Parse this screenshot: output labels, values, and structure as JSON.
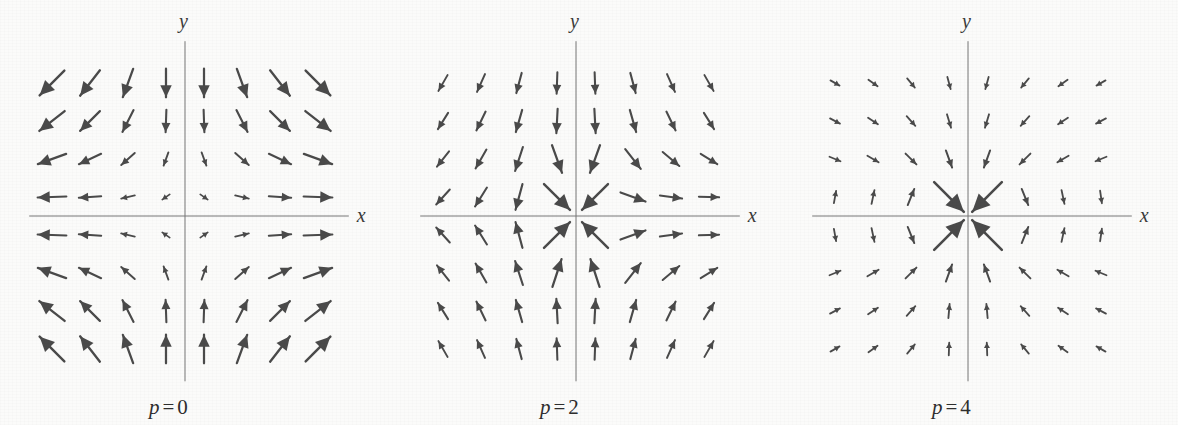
{
  "figure": {
    "background_color": "#fbfbfa",
    "ink_color": "#4a4a4a",
    "axis_color": "#777777",
    "width": 1178,
    "height": 425
  },
  "panels": [
    {
      "id": "panel-p0",
      "caption_symbol": "p",
      "caption_eq": "=",
      "caption_value": "0",
      "caption_full": "p = 0",
      "x_axis_label": "x",
      "y_axis_label": "y",
      "origin_x": 185,
      "origin_y": 216,
      "grid_spacing": 38,
      "grid_n": 8,
      "arrow_scale": 1.0
    },
    {
      "id": "panel-p2",
      "caption_symbol": "p",
      "caption_eq": "=",
      "caption_value": "2",
      "caption_full": "p = 2",
      "x_axis_label": "x",
      "y_axis_label": "y",
      "origin_x": 576,
      "origin_y": 216,
      "grid_spacing": 38,
      "grid_n": 8,
      "arrow_scale": 1.0
    },
    {
      "id": "panel-p4",
      "caption_symbol": "p",
      "caption_eq": "=",
      "caption_value": "4",
      "caption_full": "p = 4",
      "x_axis_label": "x",
      "y_axis_label": "y",
      "origin_x": 968,
      "origin_y": 216,
      "grid_spacing": 38,
      "grid_n": 8,
      "arrow_scale": 1.0
    }
  ],
  "chart_data": [
    {
      "type": "quiver",
      "title": "p = 0",
      "xlabel": "x",
      "ylabel": "y",
      "p": 0,
      "grid_x": [
        -3.5,
        -2.5,
        -1.5,
        -0.5,
        0.5,
        1.5,
        2.5,
        3.5
      ],
      "grid_y": [
        3.5,
        2.5,
        1.5,
        0.5,
        -0.5,
        -1.5,
        -2.5,
        -3.5
      ],
      "xlim": [
        -4,
        4
      ],
      "ylim": [
        -4,
        4
      ],
      "grid": false,
      "legend": "none",
      "description": "Rotational direction field; arrow direction angle = atan2(x, -y) style vortex, magnitude grows with distance from origin.",
      "angles_deg": [
        [
          225,
          232,
          250,
          270,
          270,
          290,
          308,
          315
        ],
        [
          218,
          225,
          243,
          268,
          272,
          297,
          315,
          322
        ],
        [
          200,
          205,
          222,
          250,
          290,
          318,
          335,
          340
        ],
        [
          182,
          184,
          193,
          215,
          325,
          347,
          356,
          358
        ],
        [
          178,
          176,
          167,
          145,
          35,
          13,
          4,
          2
        ],
        [
          160,
          155,
          138,
          110,
          70,
          42,
          25,
          20
        ],
        [
          142,
          135,
          117,
          92,
          88,
          63,
          45,
          38
        ],
        [
          135,
          128,
          110,
          90,
          90,
          70,
          52,
          45
        ]
      ],
      "magnitudes": [
        [
          1.0,
          0.92,
          0.86,
          0.82,
          0.82,
          0.86,
          0.92,
          1.0
        ],
        [
          0.92,
          0.8,
          0.7,
          0.64,
          0.64,
          0.7,
          0.8,
          0.92
        ],
        [
          0.86,
          0.7,
          0.52,
          0.4,
          0.4,
          0.52,
          0.7,
          0.86
        ],
        [
          0.82,
          0.64,
          0.4,
          0.26,
          0.26,
          0.4,
          0.64,
          0.82
        ],
        [
          0.82,
          0.64,
          0.4,
          0.26,
          0.26,
          0.4,
          0.64,
          0.82
        ],
        [
          0.86,
          0.7,
          0.52,
          0.4,
          0.4,
          0.52,
          0.7,
          0.86
        ],
        [
          0.92,
          0.8,
          0.7,
          0.64,
          0.64,
          0.7,
          0.8,
          0.92
        ],
        [
          1.0,
          0.92,
          0.86,
          0.82,
          0.82,
          0.86,
          0.92,
          1.0
        ]
      ]
    },
    {
      "type": "quiver",
      "title": "p = 2",
      "xlabel": "x",
      "ylabel": "y",
      "p": 2,
      "grid_x": [
        -3.5,
        -2.5,
        -1.5,
        -0.5,
        0.5,
        1.5,
        2.5,
        3.5
      ],
      "grid_y": [
        3.5,
        2.5,
        1.5,
        0.5,
        -0.5,
        -1.5,
        -2.5,
        -3.5
      ],
      "xlim": [
        -4,
        4
      ],
      "ylim": [
        -4,
        4
      ],
      "grid": false,
      "legend": "none",
      "description": "Direction field with p = 2 angular winding; strong diagonal outflow arrows adjacent to the origin.",
      "angles_deg": [
        [
          240,
          246,
          255,
          268,
          272,
          285,
          294,
          300
        ],
        [
          238,
          244,
          254,
          267,
          273,
          286,
          296,
          302
        ],
        [
          232,
          240,
          252,
          290,
          250,
          308,
          320,
          328
        ],
        [
          228,
          238,
          255,
          315,
          225,
          340,
          352,
          358
        ],
        [
          132,
          122,
          105,
          45,
          135,
          20,
          8,
          2
        ],
        [
          128,
          120,
          108,
          72,
          108,
          52,
          40,
          32
        ],
        [
          122,
          116,
          106,
          93,
          87,
          74,
          64,
          58
        ],
        [
          120,
          114,
          105,
          92,
          88,
          75,
          66,
          60
        ]
      ],
      "magnitudes": [
        [
          0.52,
          0.56,
          0.6,
          0.62,
          0.62,
          0.6,
          0.56,
          0.52
        ],
        [
          0.55,
          0.6,
          0.66,
          0.7,
          0.7,
          0.66,
          0.6,
          0.55
        ],
        [
          0.56,
          0.62,
          0.72,
          0.84,
          0.84,
          0.72,
          0.62,
          0.56
        ],
        [
          0.58,
          0.64,
          0.76,
          1.05,
          1.05,
          0.76,
          0.64,
          0.58
        ],
        [
          0.58,
          0.64,
          0.76,
          1.05,
          1.05,
          0.76,
          0.64,
          0.58
        ],
        [
          0.56,
          0.62,
          0.72,
          0.84,
          0.84,
          0.72,
          0.62,
          0.56
        ],
        [
          0.55,
          0.6,
          0.66,
          0.7,
          0.7,
          0.66,
          0.6,
          0.55
        ],
        [
          0.52,
          0.56,
          0.6,
          0.62,
          0.62,
          0.6,
          0.56,
          0.52
        ]
      ]
    },
    {
      "type": "quiver",
      "title": "p = 4",
      "xlabel": "x",
      "ylabel": "y",
      "p": 4,
      "grid_x": [
        -3.5,
        -2.5,
        -1.5,
        -0.5,
        0.5,
        1.5,
        2.5,
        3.5
      ],
      "grid_y": [
        3.5,
        2.5,
        1.5,
        0.5,
        -0.5,
        -1.5,
        -2.5,
        -3.5
      ],
      "xlim": [
        -4,
        4
      ],
      "ylim": [
        -4,
        4
      ],
      "grid": false,
      "legend": "none",
      "description": "Direction field with p = 4 angular winding; four long arrows form a diamond outline around the origin, remaining arrows are short.",
      "angles_deg": [
        [
          330,
          325,
          310,
          285,
          255,
          230,
          215,
          210
        ],
        [
          332,
          326,
          312,
          287,
          253,
          228,
          214,
          208
        ],
        [
          338,
          330,
          315,
          290,
          250,
          225,
          210,
          202
        ],
        [
          80,
          78,
          68,
          315,
          225,
          292,
          282,
          278
        ],
        [
          280,
          282,
          292,
          45,
          135,
          68,
          78,
          82
        ],
        [
          22,
          30,
          45,
          70,
          110,
          135,
          150,
          158
        ],
        [
          28,
          34,
          48,
          85,
          95,
          132,
          146,
          152
        ],
        [
          30,
          36,
          50,
          88,
          92,
          130,
          144,
          150
        ]
      ],
      "magnitudes": [
        [
          0.3,
          0.32,
          0.34,
          0.36,
          0.36,
          0.34,
          0.32,
          0.3
        ],
        [
          0.32,
          0.34,
          0.37,
          0.4,
          0.4,
          0.37,
          0.34,
          0.32
        ],
        [
          0.34,
          0.37,
          0.44,
          0.52,
          0.52,
          0.44,
          0.37,
          0.34
        ],
        [
          0.36,
          0.4,
          0.5,
          1.2,
          1.2,
          0.5,
          0.4,
          0.36
        ],
        [
          0.36,
          0.4,
          0.5,
          1.2,
          1.2,
          0.5,
          0.4,
          0.36
        ],
        [
          0.34,
          0.37,
          0.44,
          0.52,
          0.52,
          0.44,
          0.37,
          0.34
        ],
        [
          0.32,
          0.34,
          0.37,
          0.4,
          0.4,
          0.37,
          0.34,
          0.32
        ],
        [
          0.3,
          0.32,
          0.34,
          0.36,
          0.36,
          0.34,
          0.32,
          0.3
        ]
      ]
    }
  ]
}
